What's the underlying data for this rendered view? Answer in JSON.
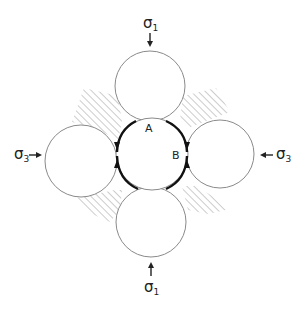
{
  "diagram": {
    "type": "grain-packing-stress-diagram",
    "stress_labels": {
      "top": {
        "symbol": "σ",
        "subscript": "1"
      },
      "bottom": {
        "symbol": "σ",
        "subscript": "1"
      },
      "left": {
        "symbol": "σ",
        "subscript": "3"
      },
      "right": {
        "symbol": "σ",
        "subscript": "3"
      }
    },
    "point_labels": {
      "a": "A",
      "b": "B"
    },
    "grains": [
      {
        "name": "top",
        "cx": 150,
        "cy": 86,
        "r": 35
      },
      {
        "name": "left",
        "cx": 81,
        "cy": 161,
        "r": 36
      },
      {
        "name": "right",
        "cx": 220,
        "cy": 154,
        "r": 34
      },
      {
        "name": "bottom",
        "cx": 151,
        "cy": 222,
        "r": 35
      },
      {
        "name": "center",
        "cx": 152,
        "cy": 154,
        "r": 36
      }
    ],
    "colors": {
      "outline": "#8a8a8a",
      "hatch": "#9a9a9a",
      "bold": "#111111"
    }
  }
}
